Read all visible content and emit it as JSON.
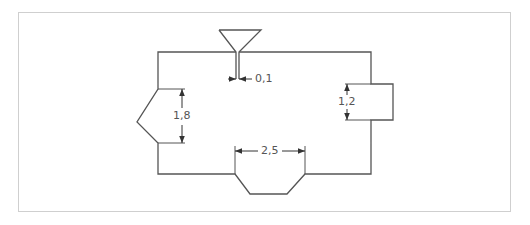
{
  "figure": {
    "type": "mold-cavity-dimension-drawing",
    "colors": {
      "line": "#555555",
      "frame": "#cfcfcf",
      "text": "#555555"
    },
    "dimensions": [
      {
        "id": "gate_width",
        "label": "0,1"
      },
      {
        "id": "left_notch_height",
        "label": "1,8"
      },
      {
        "id": "right_boss_height",
        "label": "1,2"
      },
      {
        "id": "bottom_notch_width",
        "label": "2,5"
      }
    ],
    "features": {
      "sprue": "triangle-funnel-on-top",
      "left_notch": "v-notch-pointing-left",
      "right_boss": "rectangular-protrusion-right",
      "bottom_notch": "trapezoid-protrusion-bottom"
    }
  }
}
